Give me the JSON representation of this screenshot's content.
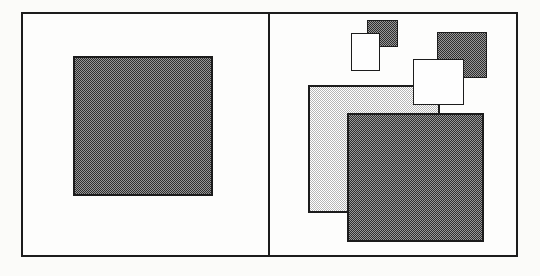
{
  "figure": {
    "page_background": "#fbfbf9",
    "panel_background": "#fdfdfc",
    "line_color": "#1c1c1c",
    "frame": {
      "x": 21,
      "y": 12,
      "w": 497,
      "h": 245,
      "border": 2
    },
    "divider": {
      "x": 268,
      "y": 12,
      "w": 2,
      "h": 245
    },
    "patterns": {
      "dark": {
        "type": "checker",
        "c1": "#2e2e2e",
        "c2": "#979797",
        "cell": 2
      },
      "light": {
        "type": "checker",
        "c1": "#b5b5b5",
        "c2": "#ffffff",
        "cell": 2
      },
      "white": {
        "type": "solid",
        "fill": "#fefefe"
      }
    },
    "panels": [
      {
        "name": "left-panel",
        "shapes": [
          {
            "name": "shaded-square-large-left",
            "x": 73,
            "y": 56,
            "w": 140,
            "h": 140,
            "fill": "dark",
            "border": 2
          }
        ]
      },
      {
        "name": "right-panel",
        "shapes": [
          {
            "name": "shaded-square-small",
            "x": 367,
            "y": 20,
            "w": 31,
            "h": 27,
            "fill": "dark",
            "border": 1.5
          },
          {
            "name": "white-square-small",
            "x": 351,
            "y": 33,
            "w": 29,
            "h": 38,
            "fill": "white",
            "border": 1.5
          },
          {
            "name": "shaded-square-medium",
            "x": 437,
            "y": 32,
            "w": 50,
            "h": 46,
            "fill": "dark",
            "border": 1.5
          },
          {
            "name": "light-shaded-square",
            "x": 308,
            "y": 85,
            "w": 132,
            "h": 128,
            "fill": "light",
            "border": 2
          },
          {
            "name": "white-square-medium",
            "x": 413,
            "y": 59,
            "w": 51,
            "h": 46,
            "fill": "white",
            "border": 1.5
          },
          {
            "name": "shaded-square-xlarge",
            "x": 347,
            "y": 113,
            "w": 137,
            "h": 129,
            "fill": "dark",
            "border": 2
          }
        ]
      }
    ]
  }
}
